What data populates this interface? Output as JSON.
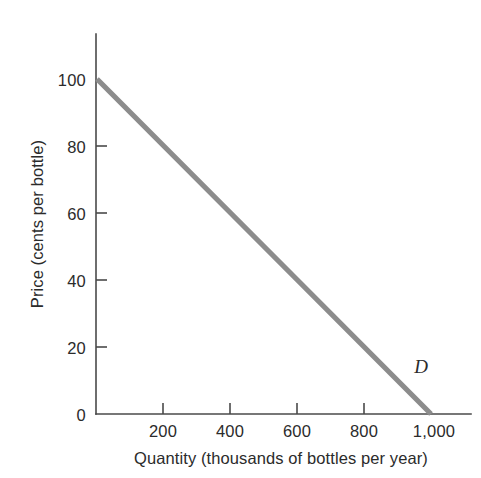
{
  "chart_data": {
    "type": "line",
    "title": "",
    "subtitle": "",
    "xlabel": "Quantity (thousands of bottles per year)",
    "ylabel": "Price (cents per bottle)",
    "xlim": [
      0,
      1100
    ],
    "ylim": [
      0,
      110
    ],
    "grid": false,
    "legend_position": "inline-curve-label",
    "x_ticks": [
      {
        "value": 0,
        "label": "0"
      },
      {
        "value": 200,
        "label": "200"
      },
      {
        "value": 400,
        "label": "400"
      },
      {
        "value": 600,
        "label": "600"
      },
      {
        "value": 800,
        "label": "800"
      },
      {
        "value": 1000,
        "label": "1,000"
      }
    ],
    "y_ticks": [
      {
        "value": 0,
        "label": "0"
      },
      {
        "value": 20,
        "label": "20"
      },
      {
        "value": 40,
        "label": "40"
      },
      {
        "value": 60,
        "label": "60"
      },
      {
        "value": 80,
        "label": "80"
      },
      {
        "value": 100,
        "label": "100"
      }
    ],
    "series": [
      {
        "name": "D",
        "label": "D",
        "color": "#8c8c8c",
        "x": [
          0,
          200,
          400,
          600,
          800,
          1000
        ],
        "values": [
          100,
          80,
          60,
          40,
          20,
          0
        ],
        "points": [
          {
            "x": 0,
            "y": 100
          },
          {
            "x": 200,
            "y": 80
          },
          {
            "x": 400,
            "y": 60
          },
          {
            "x": 600,
            "y": 40
          },
          {
            "x": 800,
            "y": 20
          },
          {
            "x": 1000,
            "y": 0
          }
        ]
      }
    ],
    "annotations": [
      {
        "text": "D",
        "x": 930,
        "y": 14,
        "style": "italic"
      }
    ]
  },
  "axes": {
    "y_axis_title": "Price (cents per bottle)",
    "x_axis_title": "Quantity (thousands of bottles per year)",
    "origin_label": "0"
  },
  "colors": {
    "curve": "#8c8c8c",
    "axis": "#4a4a4a",
    "text": "#2b2b2b",
    "background": "#ffffff"
  }
}
